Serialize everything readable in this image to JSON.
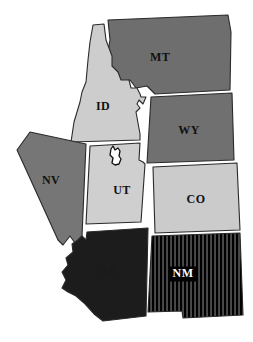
{
  "map": {
    "title": "Western United States States Map",
    "background_color": "#ffffff",
    "border_color": "#2a2a2a",
    "rotation_hint_degrees": -4,
    "states": [
      {
        "code": "MT",
        "name": "Montana",
        "fill": "#6e6e6e",
        "pattern": "solid",
        "label": "MT",
        "label_x": 160,
        "label_y": 58,
        "label_style": "dark",
        "points": "108,20 228,15 231,32 230,90 155,94 147,86 136,88 130,80 118,82 112,74 106,62 110,40"
      },
      {
        "code": "ID",
        "name": "Idaho",
        "fill": "#cdcdcd",
        "pattern": "solid",
        "label": "ID",
        "label_x": 103,
        "label_y": 107,
        "label_style": "dark",
        "points": "93,25 104,24 106,40 112,56 112,66 118,72 121,80 129,80 131,88 137,88 140,94 141,97 146,97 143,104 139,100 137,104 140,108 136,112 140,134 140,140 71,142 74,122 80,102 82,92 86,82 88,60 90,42"
      },
      {
        "code": "WY",
        "name": "Wyoming",
        "fill": "#707070",
        "pattern": "solid",
        "label": "WY",
        "label_x": 189,
        "label_y": 131,
        "label_style": "dark",
        "points": "151,97 232,93 234,160 147,163"
      },
      {
        "code": "NV",
        "name": "Nevada",
        "fill": "#767676",
        "pattern": "solid",
        "label": "NV",
        "label_x": 51,
        "label_y": 181,
        "label_style": "dark",
        "points": "30,132 86,144 82,236 75,243 70,236 63,245 58,240 23,163 17,150"
      },
      {
        "code": "UT",
        "name": "Utah",
        "fill": "#cfcfcf",
        "pattern": "solid",
        "label": "UT",
        "label_x": 122,
        "label_y": 191,
        "label_style": "dark",
        "points": "90,146 140,143 139,160 143,162 145,164 141,222 86,224"
      },
      {
        "code": "CO",
        "name": "Colorado",
        "fill": "#cbcbcb",
        "pattern": "solid",
        "label": "CO",
        "label_x": 196,
        "label_y": 200,
        "label_style": "dark",
        "points": "153,167 237,163 240,230 155,233"
      },
      {
        "code": "AZ",
        "name": "Arizona",
        "fill": "#1c1c1c",
        "pattern": "solid",
        "label": "AZ",
        "label_x": 108,
        "label_y": 273,
        "label_style": "dark-on-dark",
        "points": "87,232 148,228 146,316 103,321 94,314 84,303 76,296 68,292 62,288 66,280 62,272 68,265 66,258 73,252 72,244 78,240 82,236 86,240"
      },
      {
        "code": "NM",
        "name": "New Mexico",
        "fill": "#1a1a1a",
        "pattern": "vertical-stripes",
        "stripe_color_a": "#000000",
        "stripe_color_b": "#4a4a4a",
        "label": "NM",
        "label_x": 183,
        "label_y": 274,
        "label_style": "light-on-dark",
        "points": "152,236 240,233 243,315 183,318 182,311 148,312"
      }
    ],
    "inset_marker": {
      "name": "small-region-marker",
      "description": "small white region outline inside Utah",
      "points": "111,149 113,146 115,150 118,148 120,151 119,156 121,159 119,164 115,165 112,163 113,158 110,155"
    }
  }
}
